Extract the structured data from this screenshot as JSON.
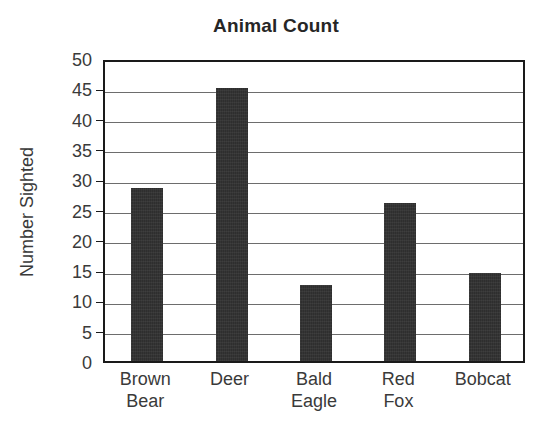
{
  "chart_data": {
    "type": "bar",
    "title": "Animal Count",
    "xlabel": "",
    "ylabel": "Number Sighted",
    "categories": [
      "Brown\nBear",
      "Deer",
      "Bald\nEagle",
      "Red\nFox",
      "Bobcat"
    ],
    "values": [
      28.5,
      45,
      12.5,
      26,
      14.5
    ],
    "ylim": [
      0,
      50
    ],
    "ytick_labels": [
      "0",
      "5",
      "10",
      "15",
      "20",
      "25",
      "30",
      "35",
      "40",
      "45",
      "50"
    ],
    "ytick_values": [
      0,
      5,
      10,
      15,
      20,
      25,
      30,
      35,
      40,
      45,
      50
    ],
    "grid": "horizontal",
    "legend": "none",
    "bar_color": "#2e2e2e",
    "frame_color": "#1a1a1a",
    "gridline_color": "#6d6d6d",
    "background_color": "#ffffff"
  }
}
